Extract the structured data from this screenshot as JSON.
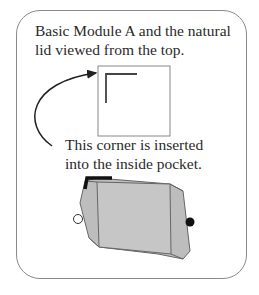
{
  "caption_top": {
    "line1": "Basic Module A and the natural",
    "line2": "lid viewed from the top."
  },
  "caption_middle": {
    "line1": "This corner is inserted",
    "line2": "into the inside pocket."
  },
  "colors": {
    "frame": "#8a8a8a",
    "text": "#2a2a2a",
    "module_fill": "#bdbdbd",
    "module_face": "#c4c4c4",
    "outline": "#555555",
    "corner": "#111111"
  }
}
